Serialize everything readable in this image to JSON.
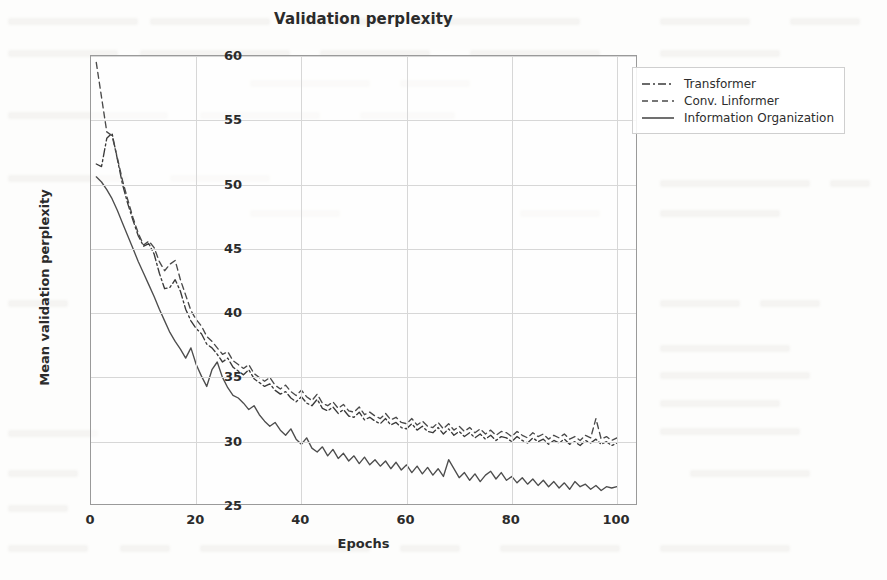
{
  "chart_data": {
    "type": "line",
    "title": "Validation perplexity",
    "xlabel": "Epochs",
    "ylabel": "Mean validation perplexity",
    "xlim": [
      0,
      104
    ],
    "ylim": [
      25,
      60
    ],
    "xticks": [
      0,
      20,
      40,
      60,
      80,
      100
    ],
    "yticks": [
      25,
      30,
      35,
      40,
      45,
      50,
      55,
      60
    ],
    "grid": true,
    "legend_position": "outside upper right",
    "x": [
      1,
      2,
      3,
      4,
      5,
      6,
      7,
      8,
      9,
      10,
      11,
      12,
      13,
      14,
      15,
      16,
      17,
      18,
      19,
      20,
      21,
      22,
      23,
      24,
      25,
      26,
      27,
      28,
      29,
      30,
      31,
      32,
      33,
      34,
      35,
      36,
      37,
      38,
      39,
      40,
      41,
      42,
      43,
      44,
      45,
      46,
      47,
      48,
      49,
      50,
      51,
      52,
      53,
      54,
      55,
      56,
      57,
      58,
      59,
      60,
      61,
      62,
      63,
      64,
      65,
      66,
      67,
      68,
      69,
      70,
      71,
      72,
      73,
      74,
      75,
      76,
      77,
      78,
      79,
      80,
      81,
      82,
      83,
      84,
      85,
      86,
      87,
      88,
      89,
      90,
      91,
      92,
      93,
      94,
      95,
      96,
      97,
      98,
      99,
      100
    ],
    "series": [
      {
        "name": "Transformer",
        "style": "dashdot",
        "color": "#3a3a3a",
        "values": [
          51.6,
          51.4,
          53.6,
          54.0,
          52.0,
          50.0,
          48.5,
          47.2,
          46.0,
          45.2,
          45.4,
          44.6,
          43.1,
          41.9,
          42.0,
          42.6,
          41.7,
          40.3,
          39.4,
          38.8,
          38.4,
          37.6,
          37.3,
          36.8,
          36.2,
          36.5,
          35.8,
          35.5,
          35.2,
          35.6,
          34.9,
          34.6,
          34.3,
          34.5,
          34.0,
          33.7,
          33.9,
          33.4,
          33.1,
          33.5,
          33.0,
          32.8,
          33.3,
          32.6,
          32.4,
          32.7,
          32.2,
          32.5,
          32.0,
          31.9,
          32.3,
          31.7,
          31.9,
          31.6,
          31.4,
          31.8,
          31.3,
          31.5,
          31.1,
          31.0,
          31.4,
          30.9,
          31.2,
          30.8,
          30.7,
          31.1,
          30.6,
          31.0,
          30.5,
          30.8,
          30.4,
          30.7,
          30.3,
          30.6,
          30.2,
          30.5,
          30.1,
          30.4,
          30.3,
          30.0,
          30.4,
          30.1,
          29.9,
          30.3,
          30.0,
          30.2,
          29.8,
          30.1,
          29.9,
          30.2,
          29.8,
          30.0,
          29.7,
          30.1,
          29.9,
          30.2,
          29.8,
          30.0,
          29.7,
          29.9
        ]
      },
      {
        "name": "Conv. Linformer",
        "style": "dashed",
        "color": "#4a4a4a",
        "values": [
          59.5,
          56.8,
          54.1,
          53.8,
          52.1,
          50.3,
          48.8,
          47.4,
          46.2,
          45.3,
          45.6,
          45.1,
          44.0,
          43.3,
          43.8,
          44.1,
          42.6,
          41.4,
          40.2,
          39.5,
          39.0,
          38.2,
          37.8,
          37.3,
          36.8,
          37.0,
          36.3,
          36.0,
          35.7,
          36.0,
          35.3,
          35.0,
          34.7,
          35.0,
          34.4,
          34.1,
          34.4,
          33.9,
          33.6,
          34.0,
          33.5,
          33.2,
          33.7,
          33.0,
          32.8,
          33.1,
          32.6,
          32.9,
          32.4,
          32.3,
          32.7,
          32.1,
          32.3,
          32.0,
          31.8,
          32.2,
          31.7,
          31.9,
          31.5,
          31.4,
          31.8,
          31.3,
          31.6,
          31.2,
          31.1,
          31.5,
          31.0,
          31.4,
          30.9,
          31.2,
          30.8,
          31.1,
          30.7,
          31.0,
          30.6,
          30.9,
          30.5,
          30.8,
          30.7,
          30.4,
          30.8,
          30.5,
          30.3,
          30.7,
          30.4,
          30.6,
          30.2,
          30.5,
          30.3,
          30.6,
          30.2,
          30.4,
          30.1,
          30.5,
          30.3,
          31.8,
          30.2,
          30.4,
          30.1,
          30.3
        ]
      },
      {
        "name": "Information Organization",
        "style": "solid",
        "color": "#4d4d4d",
        "values": [
          50.6,
          50.2,
          49.6,
          48.9,
          48.0,
          47.0,
          46.0,
          45.0,
          44.0,
          43.1,
          42.2,
          41.3,
          40.3,
          39.4,
          38.5,
          37.8,
          37.2,
          36.5,
          37.3,
          36.0,
          35.1,
          34.3,
          35.6,
          36.2,
          35.0,
          34.2,
          33.6,
          33.4,
          33.0,
          32.5,
          32.8,
          32.1,
          31.6,
          31.2,
          31.5,
          30.9,
          30.5,
          31.0,
          30.2,
          29.8,
          30.3,
          29.5,
          29.2,
          29.6,
          28.9,
          29.4,
          28.7,
          29.1,
          28.5,
          28.9,
          28.3,
          28.8,
          28.2,
          28.6,
          28.1,
          28.5,
          27.9,
          28.4,
          27.8,
          28.2,
          27.6,
          28.1,
          27.5,
          28.0,
          27.4,
          27.9,
          27.3,
          28.6,
          27.9,
          27.2,
          27.6,
          27.0,
          27.5,
          26.9,
          27.4,
          27.7,
          27.1,
          27.6,
          27.0,
          27.3,
          26.8,
          27.2,
          26.7,
          27.1,
          26.6,
          27.0,
          26.5,
          26.9,
          26.4,
          26.8,
          26.3,
          26.9,
          26.5,
          26.7,
          26.3,
          26.6,
          26.2,
          26.5,
          26.4,
          26.5
        ]
      }
    ]
  },
  "legend": {
    "items": [
      {
        "label": "Transformer"
      },
      {
        "label": "Conv. Linformer"
      },
      {
        "label": "Information Organization"
      }
    ]
  }
}
